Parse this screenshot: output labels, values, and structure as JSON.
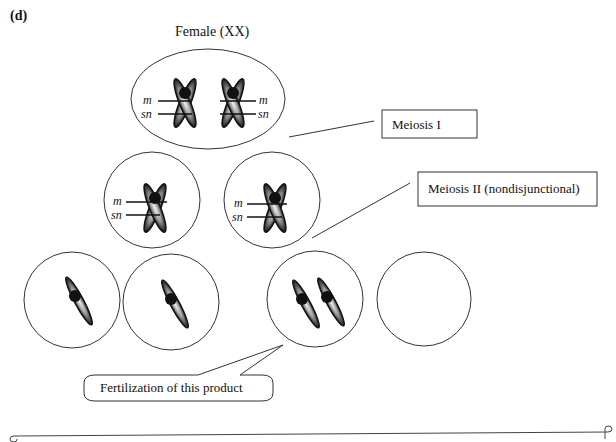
{
  "panel_label": "(d)",
  "title": "Female (XX)",
  "labels": {
    "meiosis1": "Meiosis I",
    "meiosis2": "Meiosis II (nondisjunctional)",
    "fertilization": "Fertilization of this product"
  },
  "gene_labels": {
    "m": "m",
    "sn": "sn"
  },
  "stages": [
    {
      "name": "parent-cell",
      "chromosomes": "two replicated X chromosomes with m and sn loci"
    },
    {
      "name": "meiosis-I-products",
      "cells": 2,
      "chromosomes_per_cell": "one replicated X with m and sn loci"
    },
    {
      "name": "meiosis-II-products",
      "cells": 4,
      "chromosome_counts": [
        1,
        1,
        2,
        0
      ]
    }
  ],
  "colors": {
    "stroke": "#333333",
    "chromosome": "#111111",
    "background": "#ffffff"
  }
}
